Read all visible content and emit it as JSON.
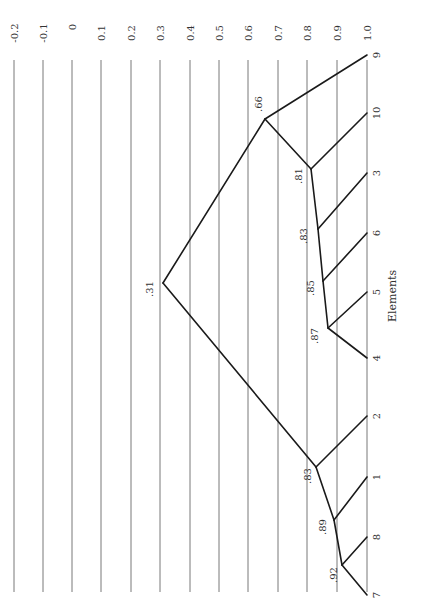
{
  "chart_data": {
    "type": "dendrogram",
    "orientation": "rotated-90",
    "title": "",
    "xlabel": "Elements",
    "ylabel": "",
    "similarity_axis": {
      "ticks": [
        "-0.2",
        "-0.1",
        "0",
        "0.1",
        "0.2",
        "0.3",
        "0.4",
        "0.5",
        "0.6",
        "0.7",
        "0.8",
        "0.9",
        "1.0"
      ],
      "range": [
        -0.2,
        1.0
      ],
      "grid": true
    },
    "leaves": [
      "9",
      "10",
      "3",
      "6",
      "5",
      "4",
      "2",
      "1",
      "8",
      "7"
    ],
    "merges": [
      {
        "id": "n87",
        "label": ".87",
        "value": 0.87,
        "children": [
          "4",
          "5"
        ]
      },
      {
        "id": "n85",
        "label": ".85",
        "value": 0.85,
        "children": [
          "n87",
          "6"
        ]
      },
      {
        "id": "n83a",
        "label": ".83",
        "value": 0.83,
        "children": [
          "n85",
          "3"
        ]
      },
      {
        "id": "n81",
        "label": ".81",
        "value": 0.81,
        "children": [
          "n83a",
          "10"
        ]
      },
      {
        "id": "n66",
        "label": ".66",
        "value": 0.66,
        "children": [
          "n81",
          "9"
        ]
      },
      {
        "id": "n92",
        "label": ".92",
        "value": 0.92,
        "children": [
          "7",
          "8"
        ]
      },
      {
        "id": "n89",
        "label": ".89",
        "value": 0.89,
        "children": [
          "n92",
          "1"
        ]
      },
      {
        "id": "n83b",
        "label": ".83",
        "value": 0.83,
        "children": [
          "n89",
          "2"
        ]
      },
      {
        "id": "n31",
        "label": ".31",
        "value": 0.31,
        "children": [
          "n66",
          "n83b"
        ]
      }
    ]
  },
  "layout": {
    "grid_x": [
      14,
      43,
      72,
      101,
      131,
      160,
      190,
      219,
      248,
      278,
      307,
      337,
      367
    ],
    "grid_top": 60,
    "grid_bottom": 592,
    "leaf_x": 367,
    "leaf_y": {
      "9": 55,
      "10": 113,
      "3": 173,
      "6": 233,
      "5": 292,
      "4": 358,
      "2": 416,
      "1": 477,
      "8": 537,
      "7": 595
    },
    "node_pos": {
      "n87": [
        328,
        328
      ],
      "n85": [
        323,
        281
      ],
      "n83a": [
        318,
        229
      ],
      "n81": [
        311,
        169
      ],
      "n66": [
        265,
        119
      ],
      "n92": [
        342,
        565
      ],
      "n89": [
        334,
        520
      ],
      "n83b": [
        316,
        467
      ],
      "n31": [
        163,
        283
      ]
    },
    "node_label_pos": {
      "n87": [
        318,
        336
      ],
      "n85": [
        314,
        288
      ],
      "n83a": [
        307,
        236
      ],
      "n81": [
        302,
        176
      ],
      "n66": [
        262,
        104
      ],
      "n92": [
        337,
        575
      ],
      "n89": [
        326,
        527
      ],
      "n83b": [
        311,
        476
      ],
      "n31": [
        153,
        289
      ]
    },
    "axis_title_pos": [
      396,
      296
    ]
  }
}
